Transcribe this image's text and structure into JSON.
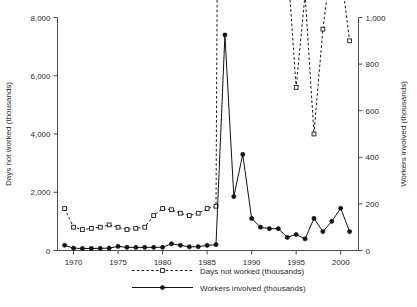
{
  "chart_data": {
    "type": "line",
    "title": "",
    "subtitle": "",
    "xlabel": "",
    "ylabel": "Days not worked (thousands)",
    "y2label": "Workers involved (thousands)",
    "grid": false,
    "legend_position": "bottom",
    "xlim": [
      1968.2,
      2002.0
    ],
    "ylim": [
      0,
      8000
    ],
    "y2lim": [
      0,
      1000
    ],
    "xticks": [
      1970,
      1975,
      1980,
      1985,
      1990,
      1995,
      2000
    ],
    "xtick_labels": [
      "1970",
      "1975",
      "1980",
      "1985",
      "1990",
      "1995",
      "2000"
    ],
    "yticks": [
      0,
      2000,
      4000,
      6000,
      8000
    ],
    "ytick_labels": [
      "0",
      "2,000",
      "4,000",
      "6,000",
      "8,000"
    ],
    "y2ticks": [
      0,
      200,
      400,
      600,
      800,
      1000
    ],
    "y2tick_labels": [
      "0",
      "200",
      "400",
      "600",
      "800",
      "1,000"
    ],
    "x": [
      1969,
      1970,
      1971,
      1972,
      1973,
      1974,
      1975,
      1976,
      1977,
      1978,
      1979,
      1980,
      1981,
      1982,
      1983,
      1984,
      1985,
      1986,
      1987,
      1988,
      1989,
      1990,
      1991,
      1992,
      1993,
      1994,
      1995,
      1996,
      1997,
      1998,
      1999,
      2000,
      2001
    ],
    "series": [
      {
        "name": "Days not worked (thousands)",
        "axis": "right",
        "marker": "open-square",
        "linestyle": "dashed",
        "color": "#1a1a1a",
        "values": [
          180,
          100,
          90,
          95,
          100,
          110,
          100,
          90,
          95,
          100,
          150,
          180,
          175,
          160,
          150,
          160,
          180,
          190,
          7350,
          5600,
          6650,
          4400,
          3150,
          1350,
          1300,
          1250,
          700,
          1100,
          500,
          950,
          1250,
          1200,
          900
        ]
      },
      {
        "name": "Workers involved (thousands)",
        "axis": "left",
        "marker": "filled-circle",
        "linestyle": "solid",
        "color": "#111111",
        "values": [
          180,
          80,
          70,
          70,
          75,
          80,
          140,
          110,
          105,
          110,
          110,
          110,
          230,
          180,
          125,
          130,
          175,
          200,
          7400,
          1850,
          3300,
          1100,
          800,
          750,
          750,
          450,
          550,
          400,
          1100,
          650,
          1000,
          1450,
          650
        ]
      }
    ],
    "legend": [
      {
        "label": "Days not worked (thousands)",
        "marker": "open-square",
        "linestyle": "dashed"
      },
      {
        "label": "Workers involved (thousands)",
        "marker": "filled-circle",
        "linestyle": "solid"
      }
    ]
  }
}
